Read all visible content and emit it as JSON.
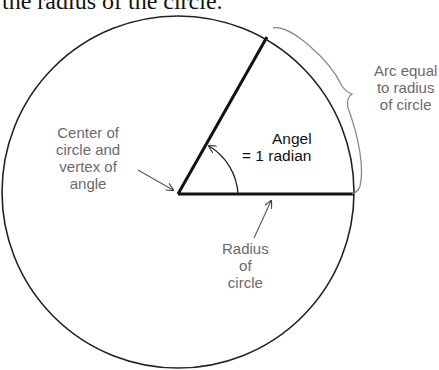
{
  "caption": "the radius of the circle.",
  "labels": {
    "arc": [
      "Arc equal",
      "to radius",
      "of circle"
    ],
    "center": [
      "Center of",
      "circle and",
      "vertex of",
      "angle"
    ],
    "angle": [
      "Angel",
      "= 1 radian"
    ],
    "radius": [
      "Radius",
      "of",
      "circle"
    ]
  },
  "geometry": {
    "center": [
      178,
      192
    ],
    "radius": 176,
    "angle_radians": 1
  },
  "colors": {
    "line": "#111111",
    "label": "#6a6a6a",
    "brace": "#8a8a8a"
  }
}
